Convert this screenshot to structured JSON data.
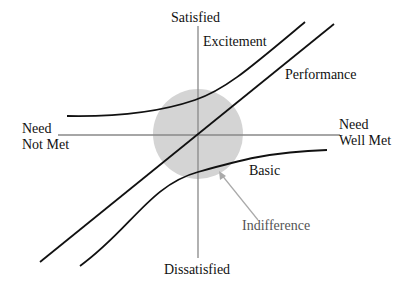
{
  "diagram": {
    "axes": {
      "y_top": "Satisfied",
      "y_bottom": "Dissatisfied",
      "x_left_line1": "Need",
      "x_left_line2": "Not Met",
      "x_right_line1": "Need",
      "x_right_line2": "Well Met"
    },
    "curves": {
      "excitement": "Excitement",
      "performance": "Performance",
      "basic": "Basic"
    },
    "region": {
      "indifference": "Indifference"
    },
    "colors": {
      "curve": "#111111",
      "axis": "#888888",
      "circle": "#d4d4d4",
      "arrow": "#aaaaaa",
      "text": "#111111",
      "indifference_text": "#555555"
    }
  }
}
